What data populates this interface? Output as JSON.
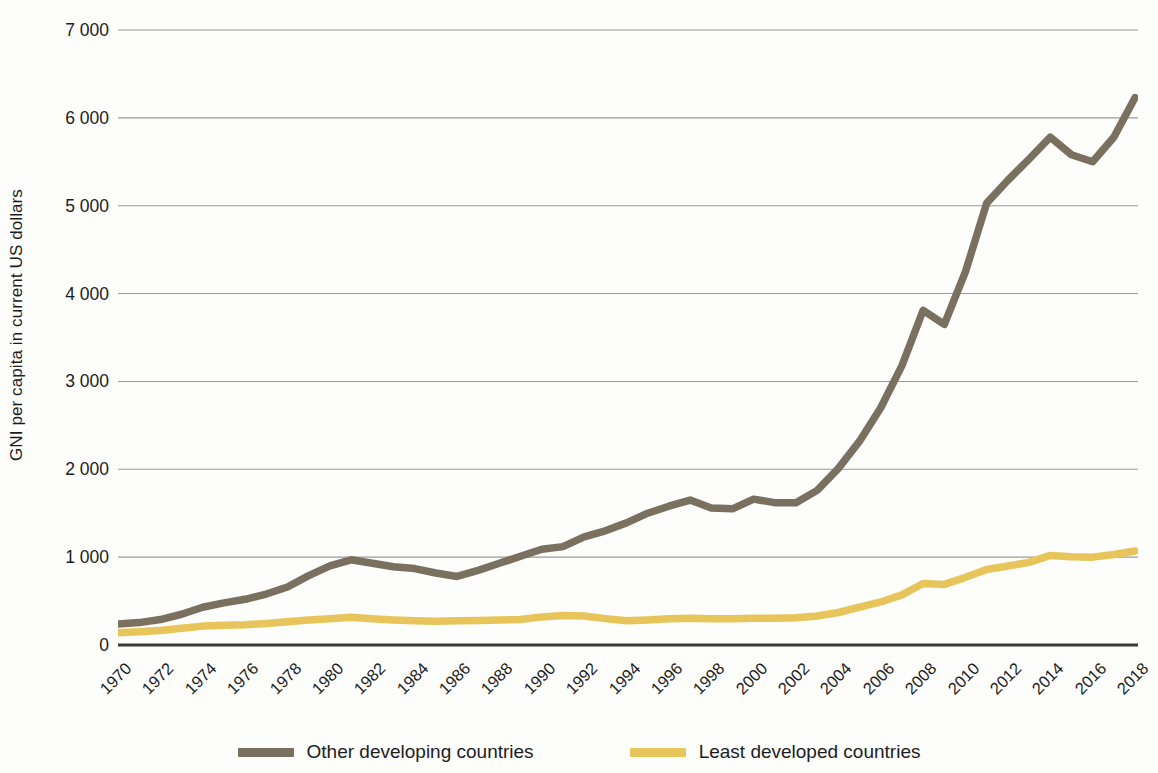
{
  "chart_data": {
    "type": "line",
    "title": "",
    "xlabel": "",
    "ylabel": "GNI per capita in current US dollars",
    "xlim": [
      1970,
      2018
    ],
    "ylim": [
      0,
      7000
    ],
    "grid": true,
    "legend_position": "bottom",
    "y_ticks": [
      "0",
      "1 000",
      "2 000",
      "3 000",
      "4 000",
      "5 000",
      "6 000",
      "7 000"
    ],
    "y_tick_values": [
      0,
      1000,
      2000,
      3000,
      4000,
      5000,
      6000,
      7000
    ],
    "x_tick_labels": [
      "1970",
      "1972",
      "1974",
      "1976",
      "1978",
      "1980",
      "1982",
      "1984",
      "1986",
      "1988",
      "1990",
      "1992",
      "1994",
      "1996",
      "1998",
      "2000",
      "2002",
      "2004",
      "2006",
      "2008",
      "2010",
      "2012",
      "2014",
      "2016",
      "2018"
    ],
    "x": [
      1970,
      1971,
      1972,
      1973,
      1974,
      1975,
      1976,
      1977,
      1978,
      1979,
      1980,
      1981,
      1982,
      1983,
      1984,
      1985,
      1986,
      1987,
      1988,
      1989,
      1990,
      1991,
      1992,
      1993,
      1994,
      1995,
      1996,
      1997,
      1998,
      1999,
      2000,
      2001,
      2002,
      2003,
      2004,
      2005,
      2006,
      2007,
      2008,
      2009,
      2010,
      2011,
      2012,
      2013,
      2014,
      2015,
      2016,
      2017,
      2018
    ],
    "series": [
      {
        "name": "Other developing countries",
        "color": "#7a7060",
        "values": [
          240,
          255,
          290,
          350,
          430,
          480,
          520,
          580,
          660,
          790,
          900,
          970,
          930,
          890,
          870,
          820,
          780,
          850,
          930,
          1010,
          1090,
          1120,
          1230,
          1300,
          1390,
          1500,
          1580,
          1650,
          1560,
          1550,
          1660,
          1620,
          1620,
          1760,
          2010,
          2320,
          2700,
          3180,
          3810,
          3650,
          4250,
          5030,
          5290,
          5530,
          5780,
          5580,
          5500,
          5780,
          6230
        ]
      },
      {
        "name": "Least developed countries",
        "color": "#e8c55a",
        "values": [
          140,
          150,
          165,
          190,
          215,
          225,
          230,
          245,
          265,
          285,
          300,
          315,
          300,
          285,
          275,
          270,
          275,
          280,
          285,
          290,
          320,
          335,
          330,
          300,
          275,
          285,
          300,
          305,
          300,
          300,
          305,
          305,
          310,
          330,
          370,
          430,
          490,
          570,
          700,
          690,
          770,
          860,
          900,
          940,
          1020,
          1005,
          1000,
          1030,
          1070
        ]
      }
    ]
  },
  "legend": {
    "items": [
      {
        "label": "Other developing countries",
        "color": "#7a7060"
      },
      {
        "label": "Least developed countries",
        "color": "#e8c55a"
      }
    ]
  },
  "axis": {
    "y_title": "GNI per capita in current US dollars"
  },
  "colors": {
    "other_developing": "#7a7060",
    "least_developed": "#e8c55a",
    "gridline": "#9a9a96",
    "baseline": "#3b3b38",
    "text": "#1c1c1c",
    "background": "#fdfdfc"
  }
}
